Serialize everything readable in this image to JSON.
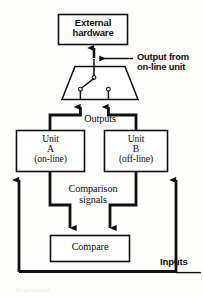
{
  "figure": {
    "type": "block-diagram",
    "background_color": "#fdfdfb",
    "line_color": "#111111",
    "text_color": "#111111"
  },
  "blocks": {
    "external_hardware": {
      "label_line1": "External",
      "label_line2": "hardware",
      "x": 58,
      "y": 14,
      "w": 70,
      "h": 31
    },
    "switch_unit": {
      "label": "",
      "shape": "trapezoid",
      "x": 62,
      "y": 66,
      "w": 76,
      "h": 34
    },
    "unit_a": {
      "label_line1": "Unit",
      "label_line2": "A",
      "label_line3": "(on-line)",
      "x": 16,
      "y": 130,
      "w": 69,
      "h": 42
    },
    "unit_b": {
      "label_line1": "Unit",
      "label_line2": "B",
      "label_line3": "(off-line)",
      "x": 104,
      "y": 130,
      "w": 64,
      "h": 42
    },
    "compare": {
      "label": "Compare",
      "x": 50,
      "y": 235,
      "w": 80,
      "h": 27
    }
  },
  "labels": {
    "outputs": "Outputs",
    "comparison_signals_line1": "Comparison",
    "comparison_signals_line2": "signals",
    "inputs": "Inputs",
    "callout_line1": "Output from",
    "callout_line2": "on-line unit"
  },
  "switch_detail": {
    "common_terminal": "pole",
    "contact_a": "on-line contact (closed)",
    "contact_b": "off-line contact (open)"
  },
  "connections": [
    {
      "name": "switch-to-external-hardware",
      "from": "switch_unit",
      "to": "external_hardware",
      "arrow": true
    },
    {
      "name": "unit-a-output-to-switch",
      "from": "unit_a",
      "to": "switch_unit",
      "arrow": true
    },
    {
      "name": "unit-b-output-to-switch",
      "from": "unit_b",
      "to": "switch_unit",
      "arrow": true
    },
    {
      "name": "unit-a-to-compare",
      "from": "unit_a",
      "to": "compare",
      "arrow": true
    },
    {
      "name": "unit-b-to-compare",
      "from": "unit_b",
      "to": "compare",
      "arrow": true
    },
    {
      "name": "inputs-to-unit-a",
      "from": "inputs-bus",
      "to": "unit_a",
      "arrow": true
    },
    {
      "name": "inputs-to-unit-b",
      "from": "inputs-bus",
      "to": "unit_b",
      "arrow": true
    }
  ]
}
